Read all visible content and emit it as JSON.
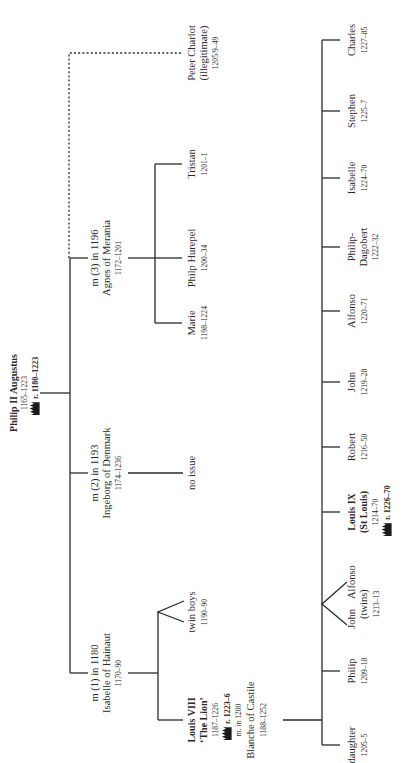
{
  "diagram": {
    "orientation": "rotated-90-counterclockwise"
  },
  "root": {
    "name": "Philip II Augustus",
    "dates": "1165–1223",
    "reign": "r. 1180–1223",
    "reign_icon": "crown-icon"
  },
  "marriages": [
    {
      "label": "m (1) in 1180",
      "spouse": "Isabelle of Hainaut",
      "dates": "1170–90",
      "children": [
        {
          "name_line1": "Louis VIII",
          "name_line2": "‘The Lion’",
          "dates": "1187–1226",
          "reign": "r. 1223–6",
          "reign_icon": "crown-icon",
          "marriage": "m. in 1200",
          "spouse": "Blanche of Castile",
          "spouse_dates": "1188–1252"
        },
        {
          "name": "twin boys",
          "dates": "1190–90"
        }
      ]
    },
    {
      "label": "m (2) in 1193",
      "spouse": "Ingeborg of Denmark",
      "dates": "1174–1236",
      "issue": "no issue"
    },
    {
      "label": "m (3) in 1196",
      "spouse": "Agnes of Merania",
      "dates": "1172–1201",
      "children": [
        {
          "name": "Marie",
          "dates": "1198–1224"
        },
        {
          "name": "Philp Hurepel",
          "dates": "1200–34"
        },
        {
          "name": "Tristan",
          "dates": "1201–1"
        }
      ]
    }
  ],
  "illegitimate": {
    "name": "Peter Charlot",
    "note": "(illegitimate)",
    "dates": "1205/9–49"
  },
  "louis_viii_children": [
    {
      "name": "daughter",
      "dates": "1205–5"
    },
    {
      "name": "Philip",
      "dates": "1209–18"
    },
    {
      "name_a": "Alfonso",
      "name_b": "John",
      "note": "(twins)",
      "dates": "1213–13"
    },
    {
      "name_line1": "Louis IX",
      "name_line2": "(St Louis)",
      "dates": "1214–70",
      "reign": "r. 1226–70",
      "reign_icon": "crown-icon"
    },
    {
      "name": "Robert",
      "dates": "1216–50"
    },
    {
      "name": "John",
      "dates": "1219–28"
    },
    {
      "name": "Alfonso",
      "dates": "1220–71"
    },
    {
      "name_line1": "Philip-",
      "name_line2": "Dagobert",
      "dates": "1222–32"
    },
    {
      "name": "Isabelle",
      "dates": "1224–70"
    },
    {
      "name": "Stephen",
      "dates": "1225–7"
    },
    {
      "name": "Charles",
      "dates": "1227–85"
    }
  ]
}
